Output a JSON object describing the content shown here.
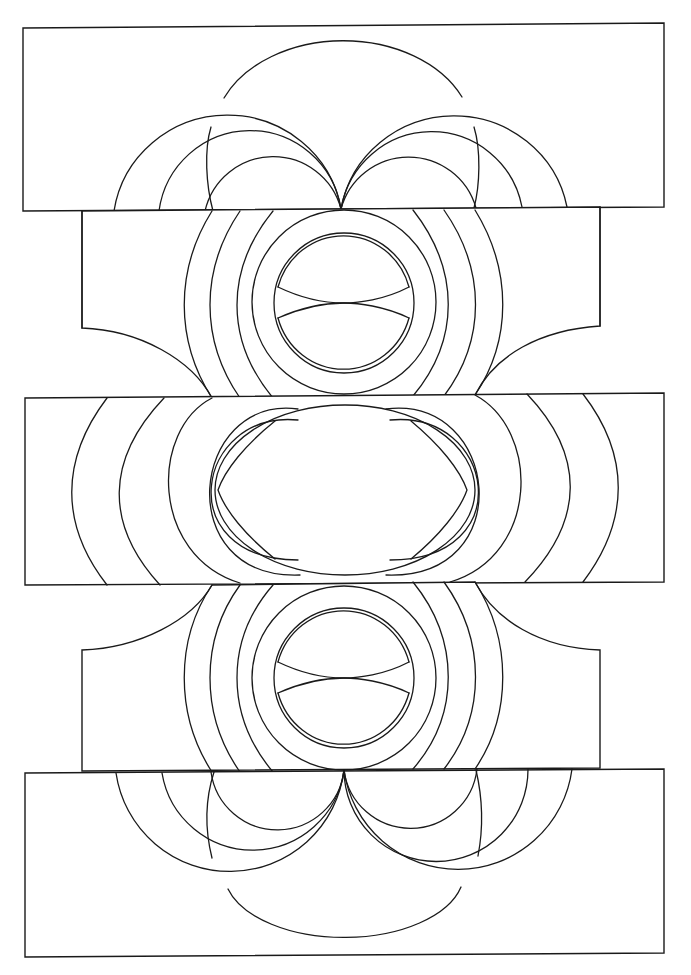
{
  "drawing": {
    "title": "",
    "style": "black line art on white",
    "background": "#ffffff",
    "stroke": "#1a1a1a",
    "bands": [
      {
        "name": "top-band",
        "shape": "rectangle"
      },
      {
        "name": "upper-middle-band",
        "shape": "notched-rectangle"
      },
      {
        "name": "center-band",
        "shape": "rectangle"
      },
      {
        "name": "lower-middle-band",
        "shape": "notched-rectangle"
      },
      {
        "name": "bottom-band",
        "shape": "rectangle"
      }
    ],
    "motifs": [
      "semicircle-dome",
      "double-half-rings",
      "concentric-circles",
      "split-lens",
      "central-ellipse",
      "side-crescents"
    ]
  }
}
